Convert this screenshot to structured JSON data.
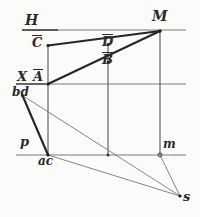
{
  "figure": {
    "paper_color": "#fbfbfa",
    "ink_color": "#2a2a2a",
    "thin_color": "#6f6f6f"
  },
  "labels": {
    "h_plane": "H",
    "m_point": "M",
    "c_bar": "C",
    "d_bar": "D",
    "b_bar": "B",
    "x_axis": "X",
    "a_bar": "A",
    "bd_trace": "bd",
    "p_point": "p",
    "ac_trace": "ac",
    "m_lower": "m",
    "s_point": "s"
  },
  "geometry": {
    "horizontals": [
      {
        "name": "h-line",
        "x1": 22,
        "y1": 30,
        "x2": 186,
        "y2": 30
      },
      {
        "name": "x-line",
        "x1": 16,
        "y1": 84,
        "x2": 186,
        "y2": 84
      },
      {
        "name": "bottom-line",
        "x1": 16,
        "y1": 155,
        "x2": 186,
        "y2": 155
      }
    ],
    "verticals": [
      {
        "name": "left-vertical",
        "x1": 48,
        "y1": 45,
        "x2": 48,
        "y2": 155
      },
      {
        "name": "middle-vertical",
        "x1": 108,
        "y1": 44,
        "x2": 108,
        "y2": 155
      },
      {
        "name": "right-vertical",
        "x1": 160,
        "y1": 31,
        "x2": 160,
        "y2": 155
      }
    ],
    "thick_lines": [
      {
        "name": "c-to-m",
        "x1": 48,
        "y1": 45,
        "x2": 160,
        "y2": 31
      },
      {
        "name": "a-to-m",
        "x1": 48,
        "y1": 84,
        "x2": 160,
        "y2": 31
      },
      {
        "name": "bd-to-ac",
        "x1": 22,
        "y1": 95,
        "x2": 48,
        "y2": 155
      }
    ],
    "thin_lines": [
      {
        "name": "bd-to-s",
        "x1": 22,
        "y1": 95,
        "x2": 180,
        "y2": 196
      },
      {
        "name": "ac-to-s",
        "x1": 48,
        "y1": 155,
        "x2": 180,
        "y2": 196
      },
      {
        "name": "m-to-s",
        "x1": 160,
        "y1": 155,
        "x2": 180,
        "y2": 196
      }
    ],
    "points": [
      {
        "name": "point-M",
        "x": 160,
        "y": 31
      },
      {
        "name": "point-C",
        "x": 48,
        "y": 45
      },
      {
        "name": "point-D",
        "x": 108,
        "y": 44
      },
      {
        "name": "point-B",
        "x": 108,
        "y": 62
      },
      {
        "name": "point-A",
        "x": 48,
        "y": 84
      },
      {
        "name": "point-bd",
        "x": 22,
        "y": 95
      },
      {
        "name": "point-ac",
        "x": 48,
        "y": 155
      },
      {
        "name": "point-m",
        "x": 160,
        "y": 155
      },
      {
        "name": "point-s",
        "x": 180,
        "y": 196
      },
      {
        "name": "point-cross",
        "x": 108,
        "y": 155
      }
    ]
  }
}
